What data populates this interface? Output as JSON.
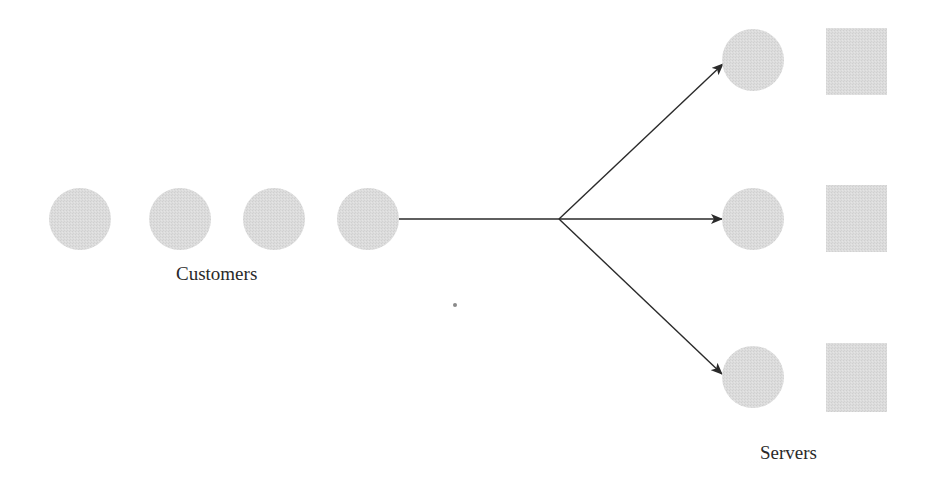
{
  "diagram": {
    "type": "queueing-system",
    "fill_color": "#d9d9d9",
    "line_color": "#2a2a2a",
    "customers": {
      "label": "Customers",
      "count": 4,
      "shape": "circle"
    },
    "servers": {
      "label": "Servers",
      "count": 3,
      "customer_shape": "circle",
      "server_shape": "square"
    },
    "flow": {
      "from": "customer-queue",
      "to": [
        "server-1",
        "server-2",
        "server-3"
      ],
      "description": "single queue branching to three parallel servers"
    }
  }
}
